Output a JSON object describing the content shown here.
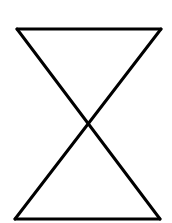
{
  "figure": {
    "shape": "hourglass",
    "stroke_color": "#000000",
    "background_color": "#ffffff",
    "stroke_width": 3,
    "vertices": {
      "top_left": [
        17,
        29
      ],
      "top_right": [
        161,
        29
      ],
      "bottom_left": [
        15,
        219
      ],
      "bottom_right": [
        160,
        219
      ]
    },
    "crossing_point": [
      88,
      123
    ]
  }
}
